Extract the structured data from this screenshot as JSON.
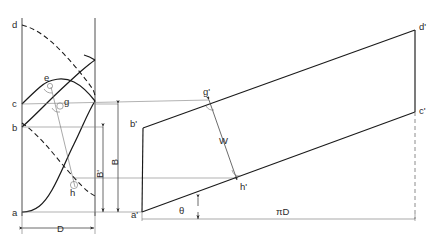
{
  "labels": {
    "a": "a",
    "b": "b",
    "c": "c",
    "d": "d",
    "e": "e",
    "g": "g",
    "h": "h",
    "a_prime": "a'",
    "b_prime": "b'",
    "c_prime": "c'",
    "d_prime": "d'",
    "g_prime": "g'",
    "h_prime": "h'"
  },
  "dimensions": {
    "diameter": "D",
    "width_B": "B",
    "width_B_prime": "B'",
    "helix_width_W": "W",
    "helix_angle": "θ",
    "circumference": "πD"
  },
  "colors": {
    "curve": "#1a1a1a",
    "projection": "#7d7d7d",
    "outline": "#3a3a3a",
    "background": "#ffffff"
  },
  "geometry": {
    "cylinder": {
      "left_x": 22,
      "right_x": 95,
      "top_y": 18,
      "bottom_y": 216,
      "points": {
        "a": [
          22,
          212
        ],
        "b": [
          22,
          127
        ],
        "c": [
          22,
          104
        ],
        "d": [
          22,
          25
        ],
        "e": [
          48,
          84
        ],
        "g": [
          61,
          107
        ],
        "h": [
          74,
          186
        ]
      }
    },
    "development": {
      "points": {
        "a_prime": [
          142,
          212
        ],
        "b_prime": [
          143,
          128
        ],
        "c_prime": [
          415,
          112
        ],
        "d_prime": [
          415,
          30
        ],
        "g_prime": [
          209,
          100
        ],
        "h_prime": [
          237,
          180
        ]
      },
      "baseline_y": 219,
      "baseline_x_start": 142,
      "baseline_x_end": 415
    }
  }
}
